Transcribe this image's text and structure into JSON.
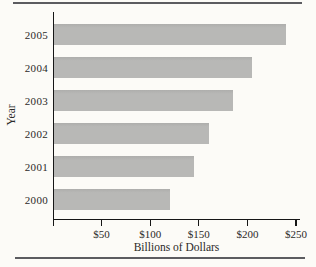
{
  "figure": {
    "background_color": "#fcfbf7",
    "rule_color": "#5c5c60"
  },
  "chart_data": {
    "type": "bar",
    "orientation": "horizontal",
    "title": "",
    "categories": [
      "2005",
      "2004",
      "2003",
      "2002",
      "2001",
      "2000"
    ],
    "values": [
      240,
      205,
      185,
      160,
      145,
      120
    ],
    "xlabel": "Billions of Dollars",
    "ylabel": "Year",
    "xlim": [
      0,
      250
    ],
    "x_tick_labels": [
      "$50",
      "$100",
      "$150",
      "$200",
      "$250"
    ],
    "x_tick_values": [
      50,
      100,
      150,
      200,
      250
    ],
    "grid": false,
    "legend": false,
    "bar_color": "#b8b8b6",
    "axis_color": "#161616"
  }
}
